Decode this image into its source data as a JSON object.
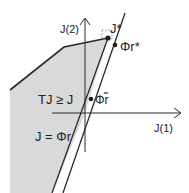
{
  "diagram": {
    "axes": {
      "x_label": "J(1)",
      "y_label": "J(2)"
    },
    "region_label": "TJ ≥ J",
    "subspace_label": "J = Φr",
    "points": {
      "j_star": "J*",
      "phi_r_star": "Φr*",
      "phi_r_tilde": "Φr̃"
    },
    "colors": {
      "region_fill": "#d6d6d6",
      "lines": "#2a2a2a"
    }
  }
}
